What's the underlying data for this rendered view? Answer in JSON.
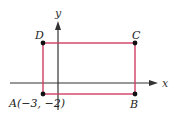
{
  "diagram": {
    "axes": {
      "x_label": "x",
      "y_label": "y",
      "color": "#333333"
    },
    "rectangle": {
      "color": "#d23c64",
      "vertices": [
        {
          "name": "A",
          "label": "A(−3, −2)",
          "coords": [
            -3,
            -2
          ]
        },
        {
          "name": "B",
          "label": "B"
        },
        {
          "name": "C",
          "label": "C"
        },
        {
          "name": "D",
          "label": "D"
        }
      ]
    },
    "point_color": "#111111"
  }
}
